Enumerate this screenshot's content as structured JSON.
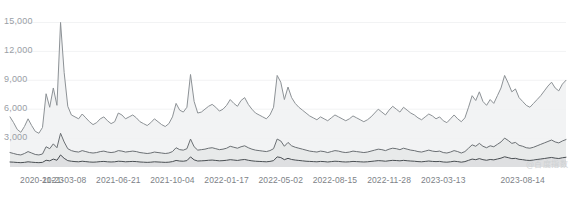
{
  "chart_data": {
    "type": "area",
    "title": "",
    "subtitle": "",
    "xlabel": "",
    "ylabel": "",
    "ylim": [
      0,
      16500
    ],
    "grid": true,
    "grid_axis": "y",
    "legend": "none",
    "watermark": "@百度指数",
    "y_ticks": [
      {
        "label": "3,000",
        "value": 3000
      },
      {
        "label": "6,000",
        "value": 6000
      },
      {
        "label": "9,000",
        "value": 9000
      },
      {
        "label": "12,000",
        "value": 12000
      },
      {
        "label": "15,000",
        "value": 15000
      }
    ],
    "x_ticks": [
      {
        "label": "2020-11-23",
        "index": 0
      },
      {
        "label": "2021-03-08",
        "index": 15
      },
      {
        "label": "2021-06-21",
        "index": 30
      },
      {
        "label": "2021-10-04",
        "index": 45
      },
      {
        "label": "2022-01-17",
        "index": 60
      },
      {
        "label": "2022-05-02",
        "index": 75
      },
      {
        "label": "2022-08-15",
        "index": 90
      },
      {
        "label": "2022-11-28",
        "index": 105
      },
      {
        "label": "2023-03-13",
        "index": 120
      },
      {
        "label": "2023-08-14",
        "index": 142
      }
    ],
    "x_range": [
      "2020-11-23",
      "2023-08-14"
    ],
    "series": [
      {
        "name": "series-1",
        "color": "#8d9296",
        "fill": "#f0f1f2",
        "values": [
          5200,
          4600,
          3900,
          3600,
          4200,
          5000,
          4300,
          3700,
          3500,
          4100,
          7600,
          6200,
          8200,
          6400,
          15000,
          9800,
          6300,
          5400,
          5200,
          5000,
          5500,
          5100,
          4700,
          4400,
          4600,
          5000,
          5200,
          4800,
          4500,
          4700,
          5600,
          5400,
          5000,
          5200,
          5400,
          5100,
          4700,
          4500,
          4300,
          4600,
          5000,
          4700,
          4400,
          4200,
          4500,
          5200,
          6600,
          5900,
          5700,
          6200,
          9600,
          6800,
          5600,
          5700,
          6000,
          6300,
          6500,
          6200,
          5800,
          6000,
          6400,
          7000,
          6600,
          6300,
          6900,
          7200,
          6500,
          6000,
          5600,
          5400,
          5200,
          5000,
          5400,
          6200,
          9500,
          8800,
          7000,
          8300,
          7200,
          6600,
          6200,
          5900,
          5600,
          5300,
          5100,
          4900,
          5200,
          5000,
          4800,
          5100,
          5400,
          5200,
          5000,
          4800,
          5000,
          5300,
          5100,
          4900,
          4700,
          4900,
          5200,
          5600,
          6000,
          5700,
          5400,
          5900,
          6300,
          6000,
          5700,
          6200,
          5900,
          5600,
          5400,
          5100,
          4900,
          5200,
          5500,
          5300,
          5000,
          5200,
          4800,
          4600,
          5000,
          5400,
          5000,
          4700,
          5100,
          6200,
          7400,
          6900,
          7800,
          6800,
          6400,
          7000,
          6600,
          7400,
          8200,
          9500,
          8700,
          7800,
          8100,
          7200,
          6800,
          6400,
          6200,
          6600,
          7000,
          7400,
          7900,
          8400,
          8800,
          8200,
          7900,
          8600,
          9000
        ]
      },
      {
        "name": "series-2",
        "color": "#6b7074",
        "fill": "#e6e7e8",
        "values": [
          1500,
          1400,
          1300,
          1250,
          1400,
          1600,
          1450,
          1300,
          1250,
          1350,
          2100,
          1900,
          2400,
          2000,
          3500,
          2600,
          1900,
          1700,
          1600,
          1550,
          1700,
          1600,
          1500,
          1450,
          1500,
          1600,
          1650,
          1550,
          1500,
          1550,
          1700,
          1650,
          1550,
          1600,
          1650,
          1600,
          1500,
          1450,
          1400,
          1450,
          1550,
          1500,
          1450,
          1400,
          1450,
          1600,
          2000,
          1800,
          1750,
          1900,
          2900,
          2100,
          1750,
          1800,
          1850,
          1950,
          2000,
          1900,
          1800,
          1850,
          1950,
          2150,
          2050,
          1950,
          2100,
          2200,
          2000,
          1850,
          1750,
          1700,
          1650,
          1600,
          1700,
          1900,
          2900,
          2700,
          2150,
          2550,
          2200,
          2050,
          1950,
          1850,
          1750,
          1650,
          1600,
          1550,
          1650,
          1600,
          1500,
          1600,
          1700,
          1650,
          1550,
          1500,
          1550,
          1650,
          1600,
          1550,
          1500,
          1550,
          1650,
          1750,
          1850,
          1800,
          1700,
          1850,
          1950,
          1900,
          1800,
          1950,
          1850,
          1750,
          1700,
          1600,
          1550,
          1650,
          1750,
          1650,
          1600,
          1650,
          1500,
          1450,
          1550,
          1700,
          1600,
          1450,
          1600,
          1950,
          2300,
          2150,
          2450,
          2150,
          2000,
          2200,
          2100,
          2350,
          2600,
          3000,
          2750,
          2450,
          2550,
          2250,
          2150,
          2000,
          1950,
          2050,
          2200,
          2350,
          2500,
          2650,
          2800,
          2600,
          2500,
          2700,
          2850
        ]
      },
      {
        "name": "series-3",
        "color": "#4a4f53",
        "fill": "#dcdddf",
        "values": [
          520,
          500,
          470,
          450,
          480,
          540,
          500,
          470,
          450,
          480,
          700,
          640,
          820,
          700,
          1250,
          900,
          660,
          600,
          560,
          540,
          600,
          560,
          520,
          500,
          520,
          560,
          580,
          540,
          520,
          540,
          600,
          580,
          540,
          560,
          580,
          560,
          520,
          500,
          480,
          500,
          540,
          520,
          500,
          480,
          500,
          560,
          680,
          620,
          600,
          660,
          1050,
          740,
          620,
          640,
          660,
          700,
          720,
          680,
          640,
          660,
          700,
          760,
          720,
          680,
          740,
          780,
          700,
          640,
          600,
          580,
          560,
          540,
          580,
          660,
          1050,
          980,
          760,
          900,
          780,
          720,
          680,
          640,
          600,
          580,
          560,
          540,
          580,
          560,
          520,
          560,
          600,
          580,
          540,
          520,
          540,
          580,
          560,
          540,
          520,
          540,
          580,
          620,
          660,
          640,
          600,
          650,
          690,
          670,
          640,
          690,
          650,
          620,
          600,
          560,
          540,
          580,
          620,
          580,
          560,
          580,
          520,
          500,
          540,
          600,
          560,
          500,
          560,
          690,
          820,
          760,
          870,
          760,
          700,
          780,
          740,
          830,
          920,
          1060,
          970,
          870,
          900,
          800,
          760,
          700,
          680,
          720,
          780,
          830,
          880,
          940,
          990,
          920,
          880,
          960,
          1010
        ]
      }
    ]
  }
}
